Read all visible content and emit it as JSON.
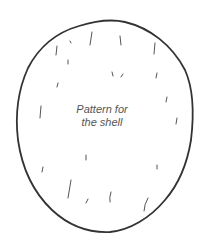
{
  "diagram": {
    "title_line1": "Pattern for",
    "title_line2": "the shell",
    "colors": {
      "outline": "#333333",
      "marks": "#555555",
      "text": "#555555",
      "background": "#ffffff"
    }
  }
}
